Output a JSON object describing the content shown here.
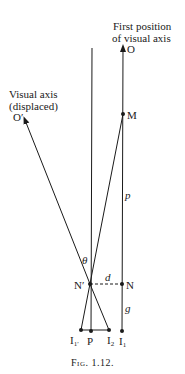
{
  "figure": {
    "caption": "Fig. 1.12.",
    "labels": {
      "first_position_line1": "First position",
      "first_position_line2": "of visual axis",
      "displaced_line1": "Visual axis",
      "displaced_line2": "(displaced)",
      "O": "O",
      "O_prime": "O′",
      "M": "M",
      "p": "p",
      "theta": "θ",
      "N_prime": "N′",
      "d": "d",
      "N": "N",
      "g": "g",
      "I1_prime": "I",
      "I1_prime_sub": "1′",
      "P": "P",
      "I2": "I",
      "I2_sub": "2",
      "I1": "I",
      "I1_sub": "1"
    },
    "line_color": "#1a1a1a"
  }
}
